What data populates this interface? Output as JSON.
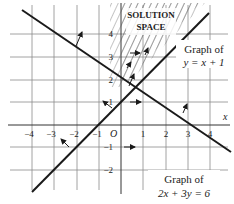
{
  "figure": {
    "type": "linear-inequalities-graph",
    "axes": {
      "x_label": "x",
      "origin_label": "O",
      "x_ticks": [
        "−4",
        "−3",
        "−2",
        "−1",
        "1",
        "2",
        "3",
        "4"
      ],
      "y_ticks": [
        "4",
        "3",
        "2",
        "1",
        "−1",
        "−2"
      ]
    },
    "region_label_line1": "SOLUTION",
    "region_label_line2": "SPACE",
    "line1": {
      "caption_line1": "Graph of",
      "caption_line2": "y = x + 1",
      "equation": "y = x + 1"
    },
    "line2": {
      "caption_line1": "Graph of",
      "caption_line2": "2x + 3y = 6",
      "equation": "2x + 3y = 6"
    },
    "colors": {
      "grid": "#8a8a8a",
      "line": "#1a1a1a",
      "hatch": "#555555",
      "background": "#ffffff"
    }
  }
}
